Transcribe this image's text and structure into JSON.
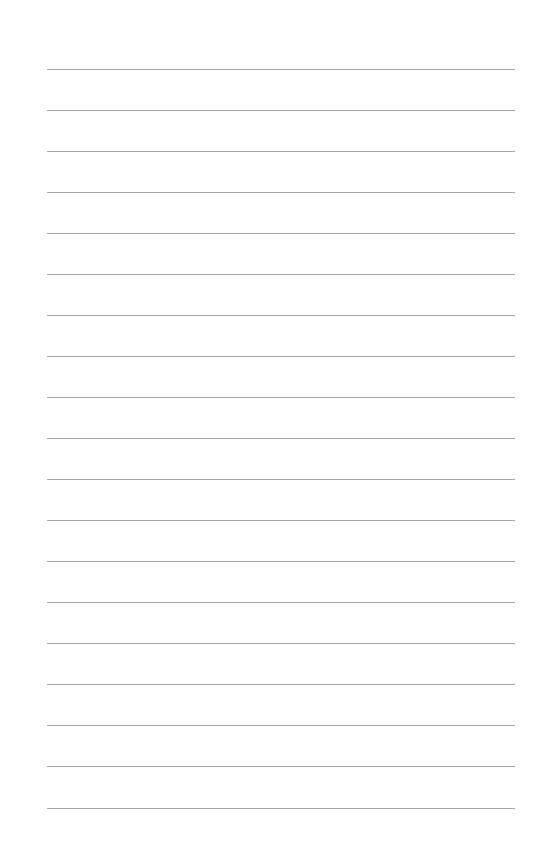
{
  "page": {
    "type": "lined-paper",
    "background": "#ffffff",
    "rule_color": "#a6a6a6",
    "rule_left": 47,
    "rule_right": 515,
    "rule_count": 19,
    "rule_positions": [
      69,
      110,
      151,
      192,
      233,
      274,
      315,
      356,
      397,
      438,
      479,
      520,
      561,
      602,
      643,
      684,
      725,
      766,
      808
    ]
  }
}
